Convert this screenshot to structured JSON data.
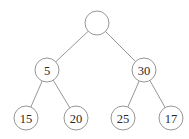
{
  "diagram": {
    "type": "binary-tree",
    "colors": {
      "stroke": "#8a8a8a",
      "text": "#2a2a2a",
      "background": "#ffffff"
    },
    "nodes": [
      {
        "id": "root",
        "label": "",
        "x": 97,
        "y": 23
      },
      {
        "id": "n5",
        "label": "5",
        "x": 47,
        "y": 70
      },
      {
        "id": "n30",
        "label": "30",
        "x": 144,
        "y": 70
      },
      {
        "id": "n15",
        "label": "15",
        "x": 26,
        "y": 118
      },
      {
        "id": "n20",
        "label": "20",
        "x": 76,
        "y": 118
      },
      {
        "id": "n25",
        "label": "25",
        "x": 123,
        "y": 118
      },
      {
        "id": "n17",
        "label": "17",
        "x": 171,
        "y": 118
      }
    ],
    "edges": [
      [
        "root",
        "n5"
      ],
      [
        "root",
        "n30"
      ],
      [
        "n5",
        "n15"
      ],
      [
        "n5",
        "n20"
      ],
      [
        "n30",
        "n25"
      ],
      [
        "n30",
        "n17"
      ]
    ],
    "radius": 12
  }
}
